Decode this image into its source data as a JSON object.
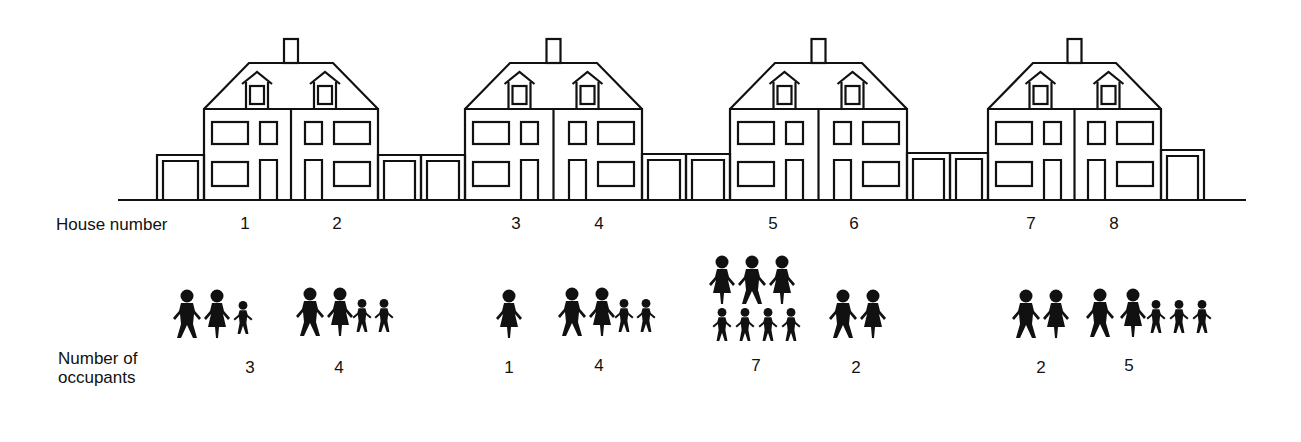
{
  "labels": {
    "house_number": "House number",
    "occupants_line1": "Number of",
    "occupants_line2": "occupants"
  },
  "houses": [
    {
      "number": "1",
      "occupants": "3",
      "figures": [
        "man",
        "woman",
        "child"
      ]
    },
    {
      "number": "2",
      "occupants": "4",
      "figures": [
        "man",
        "woman",
        "child",
        "child"
      ]
    },
    {
      "number": "3",
      "occupants": "1",
      "figures": [
        "woman"
      ]
    },
    {
      "number": "4",
      "occupants": "4",
      "figures": [
        "man",
        "woman",
        "child",
        "child"
      ]
    },
    {
      "number": "5",
      "occupants": "7",
      "figures": [
        "woman",
        "man",
        "woman",
        "child",
        "child",
        "child",
        "child"
      ]
    },
    {
      "number": "6",
      "occupants": "2",
      "figures": [
        "man",
        "woman"
      ]
    },
    {
      "number": "7",
      "occupants": "2",
      "figures": [
        "man",
        "woman"
      ]
    },
    {
      "number": "8",
      "occupants": "5",
      "figures": [
        "man",
        "woman",
        "child",
        "child",
        "child"
      ]
    }
  ],
  "colors": {
    "ink": "#111111",
    "background": "#ffffff"
  },
  "chart_data": {
    "type": "table",
    "title": "",
    "categories": [
      "1",
      "2",
      "3",
      "4",
      "5",
      "6",
      "7",
      "8"
    ],
    "xlabel": "House number",
    "ylabel": "Number of occupants",
    "values": [
      3,
      4,
      1,
      4,
      7,
      2,
      2,
      5
    ]
  }
}
